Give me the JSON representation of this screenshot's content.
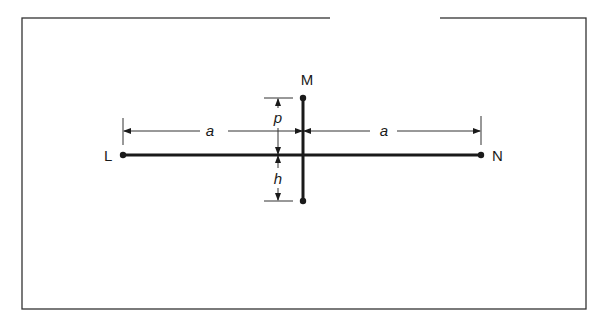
{
  "figure": {
    "frame": {
      "x": 22,
      "y": 18,
      "width": 564,
      "height": 291
    },
    "colors": {
      "ink": "#1a1a1a",
      "background": "#ffffff"
    },
    "points": {
      "L": {
        "label": "L",
        "x": 123,
        "y": 155
      },
      "N": {
        "label": "N",
        "x": 481,
        "y": 155
      },
      "M_top": {
        "label": "M",
        "x": 303,
        "y": 98
      },
      "M_bottom": {
        "x": 303,
        "y": 201
      }
    },
    "dimensions": {
      "a_left": {
        "label": "a"
      },
      "a_right": {
        "label": "a"
      },
      "p": {
        "label": "p"
      },
      "h": {
        "label": "h"
      }
    }
  }
}
